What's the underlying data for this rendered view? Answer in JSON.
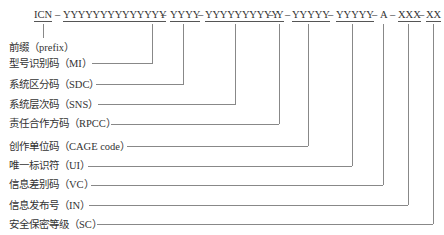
{
  "header_fragment": "ICN 编码结构示例",
  "code": {
    "segments": [
      {
        "id": "icn",
        "text": "ICN",
        "underline": true
      },
      {
        "id": "sep1",
        "text": "–",
        "underline": false
      },
      {
        "id": "mi",
        "text": "YYYYYYYYYYYYYY",
        "underline": true
      },
      {
        "id": "sep2",
        "text": "–",
        "underline": false
      },
      {
        "id": "sdc",
        "text": "YYYY",
        "underline": true
      },
      {
        "id": "sep3",
        "text": "–",
        "underline": false
      },
      {
        "id": "sns",
        "text": "YYYYYYYYYY",
        "underline": true
      },
      {
        "id": "sep4",
        "text": "–",
        "underline": false
      },
      {
        "id": "rpcc",
        "text": "Y",
        "underline": true
      },
      {
        "id": "sep5",
        "text": "–",
        "underline": false
      },
      {
        "id": "cage",
        "text": "YYYYY",
        "underline": true
      },
      {
        "id": "sep6",
        "text": "–",
        "underline": false
      },
      {
        "id": "ui",
        "text": "YYYYY",
        "underline": true
      },
      {
        "id": "sep7",
        "text": "–",
        "underline": false
      },
      {
        "id": "vc",
        "text": "A",
        "underline": false
      },
      {
        "id": "sep8",
        "text": "–",
        "underline": false
      },
      {
        "id": "in",
        "text": "XXX",
        "underline": true
      },
      {
        "id": "sep9",
        "text": "–",
        "underline": false
      },
      {
        "id": "sc",
        "text": "XX",
        "underline": true
      }
    ]
  },
  "labels": [
    {
      "id": "prefix",
      "zh": "前缀",
      "en": "（prefix）"
    },
    {
      "id": "mi",
      "zh": "型号识别码",
      "en": "（MI）"
    },
    {
      "id": "sdc",
      "zh": "系统区分码",
      "en": "（SDC）"
    },
    {
      "id": "sns",
      "zh": "系统层次码",
      "en": "（SNS）"
    },
    {
      "id": "rpcc",
      "zh": "责任合作方码",
      "en": "（RPCC）"
    },
    {
      "id": "cage",
      "zh": "创作单位码",
      "en": "（CAGE code）"
    },
    {
      "id": "ui",
      "zh": "唯一标识符",
      "en": "（UI）"
    },
    {
      "id": "vc",
      "zh": "信息差别码",
      "en": "（VC）"
    },
    {
      "id": "in",
      "zh": "信息发布号",
      "en": "（IN）"
    },
    {
      "id": "sc",
      "zh": "安全保密等级",
      "en": "（SC）"
    }
  ],
  "colors": {
    "text": "#333333",
    "line": "#888888",
    "background": "#ffffff"
  }
}
